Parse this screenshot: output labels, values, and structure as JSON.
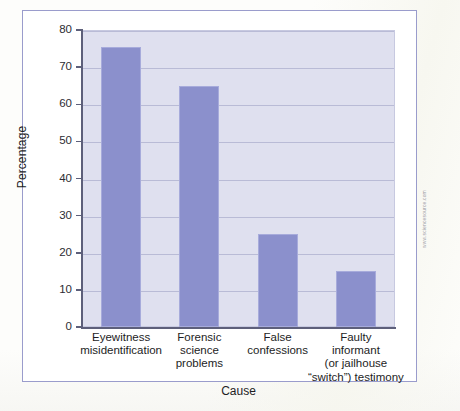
{
  "figure": {
    "source_credit": "www.sciencesource.com",
    "frame_color": "#9a9ccc"
  },
  "chart_data": {
    "type": "bar",
    "title": "",
    "xlabel": "Cause",
    "ylabel": "Percentage",
    "categories": [
      "Eyewitness misidentification",
      "Forensic science problems",
      "False confessions",
      "Faulty informant (or jailhouse “switch”) testimony"
    ],
    "category_lines": [
      [
        "Eyewitness",
        "misidentification"
      ],
      [
        "Forensic",
        "science",
        "problems"
      ],
      [
        "False",
        "confessions"
      ],
      [
        "Faulty",
        "informant",
        "(or jailhouse",
        "“switch”) testimony"
      ]
    ],
    "values": [
      75.5,
      65,
      25,
      15
    ],
    "ylim": [
      0,
      80
    ],
    "yticks": [
      0,
      10,
      20,
      30,
      40,
      50,
      60,
      70,
      80
    ],
    "ytick_labels": [
      "0",
      "10",
      "20",
      "30",
      "40",
      "50",
      "60",
      "70",
      "80"
    ],
    "grid": true,
    "legend": false,
    "bar_color": "#8b90cc",
    "plot_background": "#dfe0ef",
    "gridline_color": "#b9bbd6"
  }
}
